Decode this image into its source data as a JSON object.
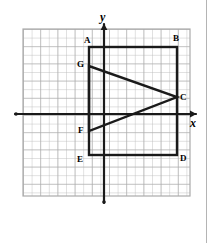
{
  "figure": {
    "kind": "coordinate-grid-geometry-figure",
    "background_color": "#ffffff",
    "grid": {
      "visible": true,
      "cell_size_px": 8.6,
      "line_color": "#b8b8b8",
      "border_color": "#b0b0b0",
      "left_px": 23,
      "top_px": 29,
      "right_px": 190,
      "bottom_px": 196,
      "columns": 19,
      "rows": 19
    },
    "axes": {
      "color": "#1a1a1a",
      "stroke_width_px": 2,
      "x_axis": {
        "label": "x",
        "label_x_px": 190,
        "label_y_px": 117,
        "y_px": 114,
        "start_x_px": 15,
        "end_x_px": 196
      },
      "y_axis": {
        "label": "y",
        "label_x_px": 100,
        "label_y_px": 11,
        "x_px": 104,
        "start_y_px": 24,
        "end_y_px": 203
      },
      "origin": {
        "x_px": 104,
        "y_px": 114
      }
    },
    "shape": {
      "name": "rectangle-with-inscribed-triangle",
      "stroke_color": "#1a1a1a",
      "stroke_width_px": 2,
      "fill": "none",
      "rectangle": {
        "name": "ABDE",
        "left_px": 89,
        "top_px": 47,
        "right_px": 177,
        "bottom_px": 155
      },
      "triangle": {
        "name": "GFC",
        "points_px": "89,66 89,131 177,97"
      }
    },
    "vertices": [
      {
        "id": "A",
        "label": "A",
        "label_x_px": 84,
        "label_y_px": 36,
        "point_x_px": 89,
        "point_y_px": 47
      },
      {
        "id": "B",
        "label": "B",
        "label_x_px": 173,
        "label_y_px": 34,
        "point_x_px": 177,
        "point_y_px": 47
      },
      {
        "id": "C",
        "label": "C",
        "label_x_px": 180,
        "label_y_px": 93,
        "point_x_px": 177,
        "point_y_px": 97
      },
      {
        "id": "D",
        "label": "D",
        "label_x_px": 180,
        "label_y_px": 154,
        "point_x_px": 177,
        "point_y_px": 155
      },
      {
        "id": "E",
        "label": "E",
        "label_x_px": 77,
        "label_y_px": 155,
        "point_x_px": 89,
        "point_y_px": 155
      },
      {
        "id": "F",
        "label": "F",
        "label_x_px": 78,
        "label_y_px": 126,
        "point_x_px": 89,
        "point_y_px": 131
      },
      {
        "id": "G",
        "label": "G",
        "label_x_px": 77,
        "label_y_px": 60,
        "point_x_px": 89,
        "point_y_px": 66
      }
    ],
    "page_border": {
      "visible": true,
      "x_px": 206,
      "color": "#b4b4b4"
    }
  }
}
